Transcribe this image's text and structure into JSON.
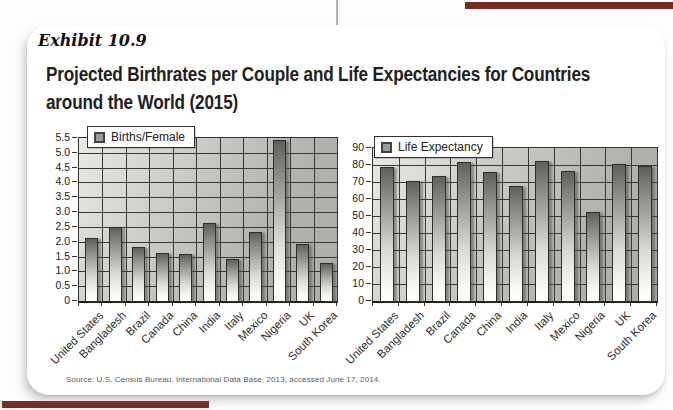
{
  "page": {
    "exhibit_label": "Exhibit 10.9",
    "title_line1": "Projected Birthrates per Couple and Life Expectancies for Countries",
    "title_line2": "around the World (2015)",
    "source": "Source: U.S. Census Bureau, International Data Base, 2013, accessed June 17, 2014.",
    "colors": {
      "accent_bar": "#7b2a24",
      "card_bg": "#ffffff",
      "grid_line": "#3a3836",
      "plot_bg_light": "#e9e9e5",
      "plot_bg_dark": "#adada9",
      "bar_top": "#5f5f5d",
      "bar_bottom": "#ffffff"
    }
  },
  "chart_data": [
    {
      "type": "bar",
      "legend": "Births/Female",
      "categories": [
        "United States",
        "Bangladesh",
        "Brazil",
        "Canada",
        "China",
        "India",
        "Italy",
        "Mexico",
        "Nigeria",
        "UK",
        "South Korea"
      ],
      "values": [
        2.1,
        2.45,
        1.8,
        1.6,
        1.55,
        2.6,
        1.4,
        2.3,
        5.4,
        1.9,
        1.25
      ],
      "title": "",
      "xlabel": "",
      "ylabel": "",
      "ylim": [
        0,
        5.5
      ],
      "ytick_step": 0.5,
      "ytick_labels_top_to_bottom": [
        "5.5",
        "5.0",
        "4.5",
        "4.0",
        "3.5",
        "3.0",
        "2.5",
        "2.0",
        "1.5",
        "1.0",
        "0.5",
        "0"
      ],
      "grid": true,
      "legend_position": "top-left"
    },
    {
      "type": "bar",
      "legend": "Life Expectancy",
      "categories": [
        "United States",
        "Bangladesh",
        "Brazil",
        "Canada",
        "China",
        "India",
        "Italy",
        "Mexico",
        "Nigeria",
        "UK",
        "South Korea"
      ],
      "values": [
        78,
        70,
        73,
        81,
        75,
        67,
        82,
        76,
        52,
        80,
        79
      ],
      "title": "",
      "xlabel": "",
      "ylabel": "",
      "ylim": [
        0,
        90
      ],
      "ytick_step": 10,
      "ytick_labels_top_to_bottom": [
        "90",
        "80",
        "70",
        "60",
        "50",
        "40",
        "30",
        "20",
        "10",
        "0"
      ],
      "grid": true,
      "legend_position": "top-left"
    }
  ]
}
